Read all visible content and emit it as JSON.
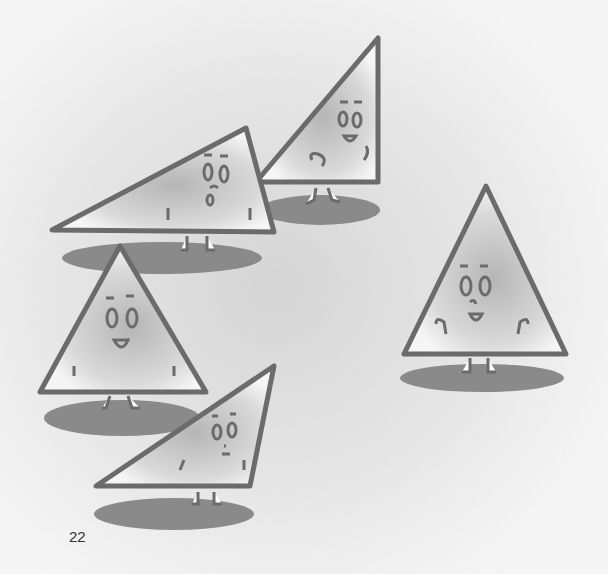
{
  "page": {
    "number": "22",
    "background_color": "#f2f2f2",
    "outline_color": "#6b6b6b",
    "shadow_color": "#8a8a8a",
    "fill_center_color": "#b8b8b8"
  },
  "illustration": {
    "subject": "five cartoon triangle characters with faces, arms and legs, each standing on an oval shadow",
    "characters": [
      {
        "id": "obtuse-triangle-top-left",
        "type": "obtuse triangle",
        "expression": "surprised"
      },
      {
        "id": "right-triangle-top-center",
        "type": "right triangle",
        "expression": "smiling, walking"
      },
      {
        "id": "isosceles-triangle-right",
        "type": "isosceles triangle",
        "expression": "happy"
      },
      {
        "id": "isosceles-triangle-left",
        "type": "isosceles triangle",
        "expression": "smiling"
      },
      {
        "id": "obtuse-triangle-bottom",
        "type": "obtuse triangle",
        "expression": "neutral"
      }
    ]
  }
}
